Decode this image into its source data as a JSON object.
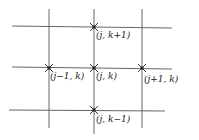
{
  "diagram": {
    "line_color": "#555555",
    "labels": {
      "top": "(j, k+1)",
      "left": "(j−1, k)",
      "center": "(j, k)",
      "right": "(j+1, k)",
      "bottom": "(j, k−1)"
    }
  }
}
